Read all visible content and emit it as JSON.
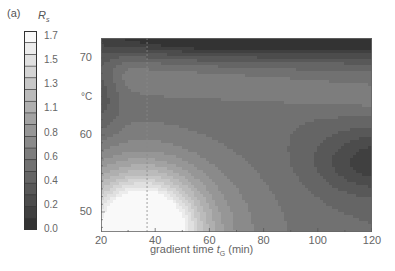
{
  "panel": {
    "label": "(a)"
  },
  "colorbar": {
    "title_symbol": "R",
    "title_subscript": "s",
    "levels": [
      0.0,
      0.1,
      0.2,
      0.3,
      0.4,
      0.5,
      0.6,
      0.7,
      0.8,
      0.9,
      1.0,
      1.1,
      1.2,
      1.3,
      1.4,
      1.5,
      1.6,
      1.7
    ],
    "tick_labels": [
      "1.7",
      "1.5",
      "1.3",
      "1.1",
      "0.8",
      "0.6",
      "0.4",
      "0.2",
      "0.0"
    ],
    "color_low": "#2a2a2a",
    "color_high": "#ffffff"
  },
  "chart_data": {
    "type": "heatmap",
    "subtype": "filled contour map (grayscale)",
    "title": "",
    "panel_label": "(a)",
    "colorbar_label": "Rs",
    "colorbar_range": [
      0.0,
      1.7
    ],
    "colorbar_ticks": [
      0.0,
      0.2,
      0.4,
      0.6,
      0.8,
      1.1,
      1.3,
      1.5,
      1.7
    ],
    "xlabel": "gradient time tG (min)",
    "ylabel": "°C",
    "xlim": [
      20,
      120
    ],
    "ylim": [
      47.4,
      72.6
    ],
    "xticks": [
      20,
      40,
      60,
      80,
      100,
      120
    ],
    "yticks": [
      50,
      60,
      70
    ],
    "grid": false,
    "annotations": [
      {
        "type": "vertical dashed line",
        "x": 37,
        "note": "marks optimum gradient time"
      }
    ],
    "features": [
      {
        "description": "maximum Rs (~1.7, white) near bottom-left",
        "x": 36,
        "y": 48,
        "value": 1.7
      },
      {
        "description": "low Rs dark band along top edge",
        "x": 100,
        "y": 72,
        "value": 0.1
      },
      {
        "description": "local minimum dark ellipse on right",
        "x": 118,
        "y": 57,
        "value": 0.25
      },
      {
        "description": "dark lobe on left-upper region",
        "x": 22,
        "y": 66,
        "value": 0.45
      },
      {
        "description": "lighter ridge running across from upper-left toward right",
        "x": 80,
        "y": 66,
        "value": 0.8
      }
    ]
  },
  "axes": {
    "xlabel_prefix": "gradient time ",
    "xlabel_symbol": "t",
    "xlabel_subscript": "G",
    "xlabel_suffix": " (min)",
    "ylabel": "°C",
    "xtick_labels": [
      "20",
      "40",
      "60",
      "80",
      "100",
      "120"
    ],
    "ytick_labels": [
      "70",
      "60",
      "50"
    ]
  }
}
